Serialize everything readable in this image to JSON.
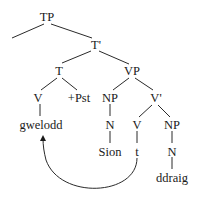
{
  "tree": {
    "nodes": {
      "tp": "TP",
      "t_bar": "T'",
      "t": "T",
      "vp": "VP",
      "v_head": "V",
      "pst": "+Pst",
      "np_subj": "NP",
      "v_bar": "V'",
      "gwelodd": "gwelodd",
      "n_subj": "N",
      "v_trace_node": "V",
      "np_obj": "NP",
      "sion": "Sion",
      "trace": "t",
      "n_obj": "N",
      "ddraig": "ddraig"
    },
    "movement_arrow": {
      "from": "t",
      "to": "gwelodd"
    }
  }
}
